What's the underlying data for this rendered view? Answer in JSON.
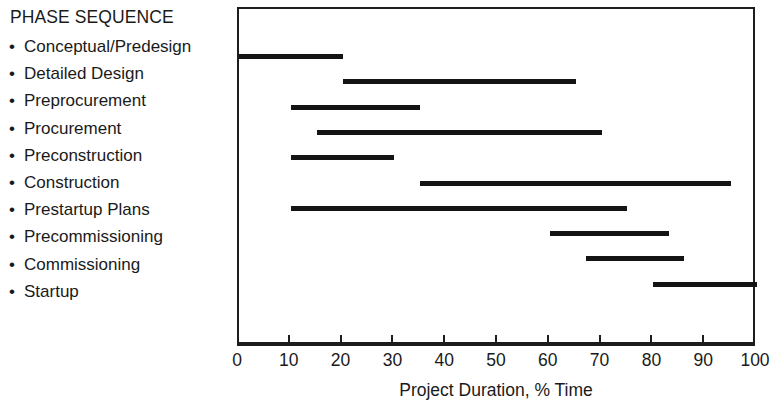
{
  "legend": {
    "heading": "PHASE SEQUENCE",
    "bullet_glyph": "•",
    "items": [
      {
        "label": "Conceptual/Predesign"
      },
      {
        "label": "Detailed Design"
      },
      {
        "label": "Preprocurement"
      },
      {
        "label": "Procurement"
      },
      {
        "label": "Preconstruction"
      },
      {
        "label": "Construction"
      },
      {
        "label": "Prestartup Plans"
      },
      {
        "label": "Precommissioning"
      },
      {
        "label": "Commissioning"
      },
      {
        "label": "Startup"
      }
    ]
  },
  "chart_data": {
    "type": "bar",
    "orientation": "horizontal",
    "title": "",
    "subtitle": "",
    "xlabel": "Project Duration, % Time",
    "ylabel": "",
    "xlim": [
      0,
      100
    ],
    "ylim": [
      0,
      10
    ],
    "xticks": [
      0,
      10,
      20,
      30,
      40,
      50,
      60,
      70,
      80,
      90,
      100
    ],
    "xtick_labels": [
      "0",
      "10",
      "20",
      "30",
      "40",
      "50",
      "60",
      "70",
      "80",
      "90",
      "100"
    ],
    "grid": false,
    "legend_position": "left-external",
    "bar_color": "#141414",
    "frame_color": "#1d1d1d",
    "categories": [
      "Conceptual/Predesign",
      "Detailed Design",
      "Preprocurement",
      "Procurement",
      "Preconstruction",
      "Construction",
      "Prestartup Plans",
      "Precommissioning",
      "Commissioning",
      "Startup"
    ],
    "bars": [
      {
        "label": "Conceptual/Predesign",
        "start": 0,
        "end": 20,
        "duration": 20
      },
      {
        "label": "Detailed Design",
        "start": 20,
        "end": 65,
        "duration": 45
      },
      {
        "label": "Preprocurement",
        "start": 10,
        "end": 35,
        "duration": 25
      },
      {
        "label": "Procurement",
        "start": 15,
        "end": 70,
        "duration": 55
      },
      {
        "label": "Preconstruction",
        "start": 10,
        "end": 30,
        "duration": 20
      },
      {
        "label": "Construction",
        "start": 35,
        "end": 95,
        "duration": 60
      },
      {
        "label": "Prestartup Plans",
        "start": 10,
        "end": 75,
        "duration": 65
      },
      {
        "label": "Precommissioning",
        "start": 60,
        "end": 83,
        "duration": 23
      },
      {
        "label": "Commissioning",
        "start": 67,
        "end": 86,
        "duration": 19
      },
      {
        "label": "Startup",
        "start": 80,
        "end": 100,
        "duration": 20
      }
    ]
  }
}
